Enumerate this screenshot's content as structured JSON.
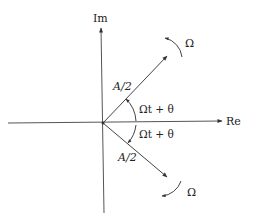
{
  "diagram": {
    "type": "phasor-diagram",
    "axes": {
      "horizontal_label": "Re",
      "vertical_label": "Im"
    },
    "vectors": [
      {
        "name": "upper-phasor",
        "magnitude_label": "A/2",
        "angle_label": "Ωt + θ",
        "rotation_label": "Ω",
        "direction": "counter-clockwise"
      },
      {
        "name": "lower-phasor",
        "magnitude_label": "A/2",
        "angle_label": "Ωt + θ",
        "rotation_label": "Ω",
        "direction": "clockwise"
      }
    ],
    "colors": {
      "line": "#333333",
      "background": "#ffffff"
    }
  }
}
